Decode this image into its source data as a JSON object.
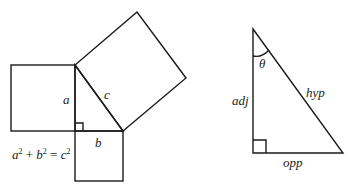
{
  "figure_left": {
    "title": "Pythagorean theorem",
    "labels": {
      "a": "a",
      "b": "b",
      "c": "c"
    },
    "equation": {
      "a": "a",
      "b": "b",
      "c": "c",
      "exp": "2",
      "plus": " + ",
      "equals": " = "
    }
  },
  "figure_right": {
    "title": "Right triangle trigonometry",
    "labels": {
      "theta": "θ",
      "adj": "adj",
      "hyp": "hyp",
      "opp": "opp"
    }
  },
  "colors": {
    "stroke": "#1a1a1a",
    "text": "#222222",
    "background": "#ffffff"
  }
}
